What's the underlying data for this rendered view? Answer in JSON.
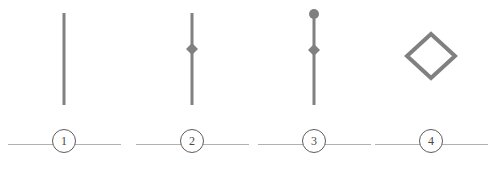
{
  "canvas": {
    "width": 501,
    "height": 170,
    "background": "#ffffff",
    "stroke_color": "#808080",
    "rule_color": "#b4b0ae",
    "badge_stroke_color": "#5f5c5b",
    "badge_text_color": "#4a4746"
  },
  "panels": [
    {
      "id": "panel-1",
      "label": "1",
      "glyph_name": "plain-vertical-line",
      "description": "Plain vertical line segment",
      "x_center": 64,
      "line": {
        "x": 64,
        "y_top": 13,
        "y_bottom": 105,
        "width": 3
      },
      "markers": []
    },
    {
      "id": "panel-2",
      "label": "2",
      "glyph_name": "vertical-line-with-center-diamond",
      "description": "Vertical line with a filled diamond at its midpoint",
      "x_center": 192,
      "line": {
        "x": 192,
        "y_top": 13,
        "y_bottom": 105,
        "width": 3
      },
      "markers": [
        {
          "type": "diamond",
          "fill": "filled",
          "cx": 192,
          "cy": 49,
          "size": 11
        }
      ]
    },
    {
      "id": "panel-3",
      "label": "3",
      "glyph_name": "vertical-line-with-top-circle-and-diamond",
      "description": "Vertical line capped by a filled circle on top with a filled diamond below",
      "x_center": 314,
      "line": {
        "x": 314,
        "y_top": 14,
        "y_bottom": 105,
        "width": 3
      },
      "markers": [
        {
          "type": "circle",
          "fill": "filled",
          "cx": 314,
          "cy": 14,
          "radius": 5
        },
        {
          "type": "diamond",
          "fill": "filled",
          "cx": 314,
          "cy": 50,
          "size": 11
        }
      ]
    },
    {
      "id": "panel-4",
      "label": "4",
      "glyph_name": "open-diamond-outline",
      "description": "Large open diamond outline",
      "x_center": 431,
      "line": null,
      "markers": [
        {
          "type": "diamond",
          "fill": "outline",
          "cx": 431,
          "cy": 56,
          "size": 48,
          "stroke_width": 4
        }
      ]
    }
  ]
}
